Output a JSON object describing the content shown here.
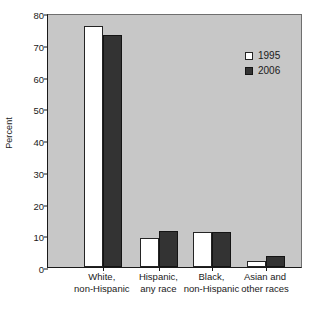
{
  "chart_data": {
    "type": "bar",
    "title": "",
    "xlabel": "",
    "ylabel": "Percent",
    "ylim": [
      0,
      80
    ],
    "yticks": [
      0,
      10,
      20,
      30,
      40,
      50,
      60,
      70,
      80
    ],
    "grid": false,
    "legend_position": "upper right",
    "categories": [
      "White,\nnon-Hispanic",
      "Hispanic,\nany race",
      "Black,\nnon-Hispanic",
      "Asian and\nother races"
    ],
    "series": [
      {
        "name": "1995",
        "color": "#ffffff",
        "values": [
          76,
          9,
          11,
          2
        ]
      },
      {
        "name": "2006",
        "color": "#333333",
        "values": [
          73,
          11.5,
          11,
          3.5
        ]
      }
    ]
  },
  "legend": {
    "items": [
      {
        "label": "1995"
      },
      {
        "label": "2006"
      }
    ]
  },
  "axis": {
    "y_title": "Percent"
  }
}
